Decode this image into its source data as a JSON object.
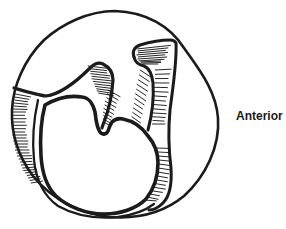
{
  "figure": {
    "label_anterior": "Anterior",
    "ink_color": "#1b1b1b",
    "background_color": "#ffffff"
  }
}
